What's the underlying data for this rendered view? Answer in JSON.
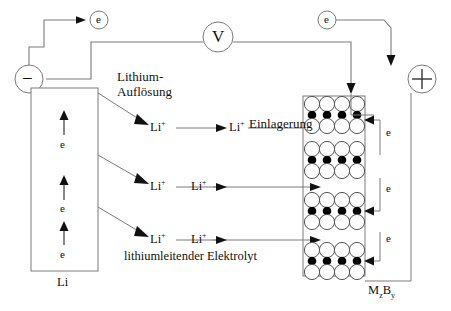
{
  "diagram": {
    "title_visible": false,
    "language": "de",
    "colors": {
      "line": "#7a7a7a",
      "line_dark": "#555555",
      "text": "#111111",
      "circle_fill_empty": "#ffffff",
      "circle_fill_full": "#000000",
      "background": "#ffffff"
    },
    "meter": {
      "label": "V",
      "name": "voltmeter"
    },
    "terminals": {
      "negative": "−",
      "positive": "+"
    },
    "electron_nodes": [
      {
        "label": "e",
        "position": "top-left"
      },
      {
        "label": "e",
        "position": "top-right"
      }
    ],
    "anode": {
      "material_label": "Li",
      "process_label_line1": "Lithium-",
      "process_label_line2": "Auflösung",
      "internal_electrons": [
        "e",
        "e",
        "e"
      ]
    },
    "electrolyte": {
      "label": "lithiumleitender Elektrolyt",
      "ion_label": "Li",
      "ion_charge": "+",
      "ion_rows": [
        {
          "left": "Li",
          "right": "Li",
          "charge": "+"
        },
        {
          "left": "Li",
          "right": "Li",
          "charge": "+"
        },
        {
          "left": "Li",
          "right": "Li",
          "charge": "+"
        }
      ]
    },
    "cathode": {
      "material_label": "M",
      "material_sub1": "z",
      "material_label2": "B",
      "material_sub2": "y",
      "process_label": "Einlagerung",
      "lattice_groups": 4,
      "rows_per_group": 3,
      "circles_per_row": 4,
      "filled_row_index": 1,
      "external_electrons": [
        "e",
        "e",
        "e"
      ]
    }
  }
}
